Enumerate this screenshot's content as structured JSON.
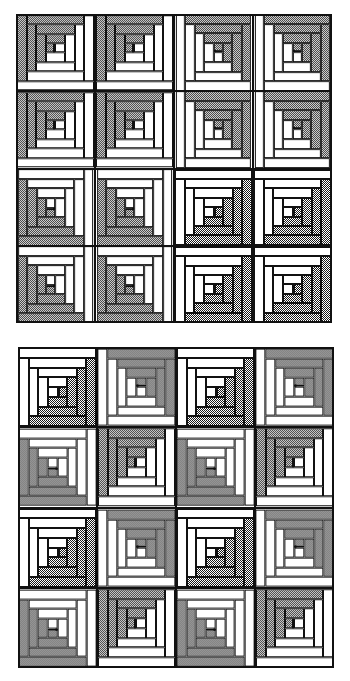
{
  "document": {
    "kind": "quilt-pattern-diagram",
    "title": "Log Cabin Quilt Layouts",
    "figure_count": 2
  },
  "palette": {
    "light_fabric": "#ffffff",
    "dark_fabric": "#808080",
    "center_square": "#0d0d0d",
    "seam_line": "#111111",
    "background": "#ffffff"
  },
  "block": {
    "name": "log-cabin-block",
    "center_label": "chimney",
    "rings": 4,
    "light_side": "upper-left",
    "dark_side": "lower-right",
    "log_widths_pct": [
      12.5,
      12.5,
      12.5,
      12.5
    ],
    "center_size_pct": 16
  },
  "quilts": [
    {
      "id": "quilt-top",
      "name": "Barn Raising variation",
      "rows": 4,
      "cols": 4,
      "block_count": 16,
      "frame": {
        "x": 16,
        "y": 14,
        "w": 316,
        "h": 309
      },
      "orientations": [
        [
          "r180",
          "r180",
          "r270",
          "r270"
        ],
        [
          "r180",
          "r180",
          "r270",
          "r270"
        ],
        [
          "r90",
          "r90",
          "r0",
          "r0"
        ],
        [
          "r90",
          "r90",
          "r0",
          "r0"
        ]
      ]
    },
    {
      "id": "quilt-bottom",
      "name": "Straight Furrows variation",
      "rows": 4,
      "cols": 4,
      "block_count": 16,
      "frame": {
        "x": 18,
        "y": 347,
        "w": 316,
        "h": 321
      },
      "orientations": [
        [
          "r0",
          "r270",
          "r0",
          "r270"
        ],
        [
          "r90",
          "r180",
          "r90",
          "r180"
        ],
        [
          "r0",
          "r270",
          "r0",
          "r270"
        ],
        [
          "r90",
          "r180",
          "r90",
          "r180"
        ]
      ]
    }
  ]
}
